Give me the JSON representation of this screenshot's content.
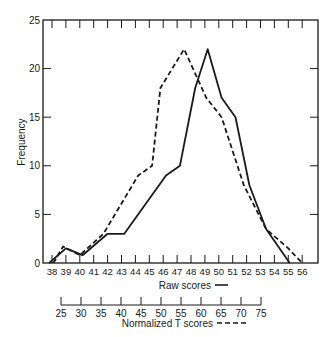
{
  "chart_data": {
    "type": "line",
    "title": "",
    "ylabel": "Frequency",
    "ylim": [
      0,
      25
    ],
    "yticks": [
      0,
      5,
      10,
      15,
      20,
      25
    ],
    "grid": false,
    "legend_position": "below x-axes (inline with axis labels)",
    "x_axes": [
      {
        "label": "Raw scores",
        "legend_style": "solid",
        "range": [
          37,
          57
        ],
        "ticks": [
          38,
          39,
          40,
          41,
          42,
          43,
          44,
          45,
          46,
          47,
          48,
          49,
          50,
          51,
          52,
          53,
          54,
          55,
          56
        ]
      },
      {
        "label": "Normalized T scores",
        "legend_style": "dashed",
        "ticks": [
          25,
          30,
          35,
          40,
          45,
          50,
          55,
          60,
          65,
          70,
          75
        ]
      }
    ],
    "series": [
      {
        "name": "Raw scores",
        "style": "solid",
        "x": [
          37.8,
          39.0,
          40.2,
          42.0,
          43.2,
          46.2,
          47.2,
          48.3,
          49.2,
          50.2,
          51.2,
          52.2,
          53.4,
          55.1
        ],
        "values": [
          0,
          1.5,
          0.8,
          3,
          3,
          9,
          10,
          18,
          22,
          17,
          15,
          8,
          3.5,
          0
        ]
      },
      {
        "name": "Normalized T scores",
        "style": "dashed",
        "x": [
          38.1,
          38.8,
          40.0,
          41.7,
          44.2,
          45.2,
          45.8,
          47.5,
          49.1,
          50.2,
          51.8,
          53.4,
          55.0,
          56.0
        ],
        "values": [
          0,
          1.7,
          0.8,
          3,
          9,
          10,
          18,
          22,
          17,
          15,
          8,
          3.5,
          1.5,
          0
        ]
      }
    ]
  },
  "labels": {
    "ylabel": "Frequency",
    "raw_axis_label": "Raw scores",
    "t_axis_label": "Normalized T scores"
  }
}
